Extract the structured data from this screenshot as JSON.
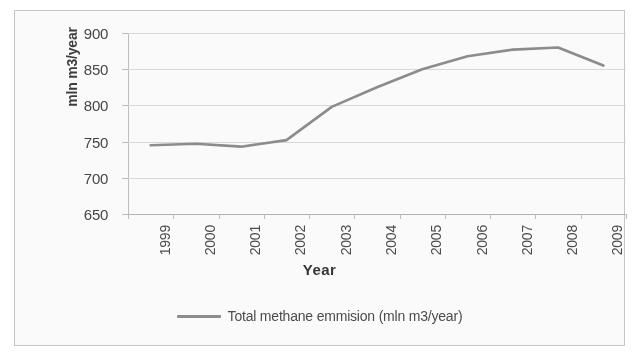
{
  "chart_data": {
    "type": "line",
    "title": "",
    "xlabel": "Year",
    "ylabel": "mln m3/year",
    "categories": [
      "1999",
      "2000",
      "2001",
      "2002",
      "2003",
      "2004",
      "2005",
      "2006",
      "2007",
      "2008",
      "2009"
    ],
    "series": [
      {
        "name": "Total methane emmision (mln m3/year)",
        "color": "#8c8c8c",
        "values": [
          745,
          747,
          743,
          752,
          798,
          825,
          850,
          868,
          877,
          880,
          855
        ]
      }
    ],
    "ylim": [
      650,
      900
    ],
    "y_ticks": [
      650,
      700,
      750,
      800,
      850,
      900
    ],
    "grid": true,
    "legend_position": "bottom"
  },
  "axes": {
    "y_title": "mln m3/year",
    "x_title": "Year",
    "y_tick_labels": [
      "900",
      "850",
      "800",
      "750",
      "700",
      "650"
    ],
    "x_tick_labels": [
      "1999",
      "2000",
      "2001",
      "2002",
      "2003",
      "2004",
      "2005",
      "2006",
      "2007",
      "2008",
      "2009"
    ]
  },
  "legend": {
    "entries": [
      {
        "label": "Total methane emmision (mln m3/year)",
        "color": "#8c8c8c"
      }
    ]
  },
  "style": {
    "series_color": "#8c8c8c",
    "gridline_color": "#dcdcdc",
    "border_color": "#c8c8c8",
    "text_color": "#444444",
    "background": "#ffffff"
  }
}
